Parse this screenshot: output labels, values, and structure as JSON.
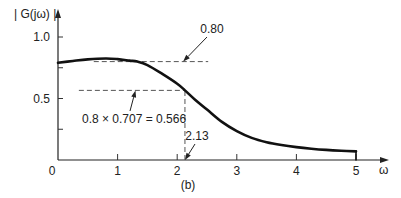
{
  "chart_data": {
    "type": "line",
    "title": "",
    "caption": "(b)",
    "xlabel": "ω",
    "ylabel": "| G(jω) |",
    "xlim": [
      0,
      5
    ],
    "ylim": [
      0,
      1.0
    ],
    "grid": false,
    "x_ticks": [
      0,
      1,
      2,
      3,
      4,
      5
    ],
    "x_tick_labels": [
      "0",
      "1",
      "2",
      "3",
      "4",
      "5"
    ],
    "y_ticks": [
      0.25,
      0.5,
      0.75,
      1.0
    ],
    "y_tick_labels": [
      "",
      "0.5",
      "",
      "1.0"
    ],
    "series": [
      {
        "name": "|G(jω)|",
        "x": [
          0,
          0.25,
          0.5,
          0.8,
          1.0,
          1.2,
          1.33,
          1.5,
          1.75,
          2.0,
          2.13,
          2.3,
          2.5,
          2.75,
          3.0,
          3.25,
          3.5,
          3.75,
          4.0,
          4.25,
          4.5,
          4.75,
          5.0
        ],
        "values": [
          0.79,
          0.805,
          0.818,
          0.825,
          0.82,
          0.808,
          0.8,
          0.772,
          0.7,
          0.62,
          0.566,
          0.49,
          0.41,
          0.31,
          0.235,
          0.18,
          0.145,
          0.122,
          0.105,
          0.092,
          0.082,
          0.075,
          0.07
        ]
      }
    ],
    "reference_lines": [
      {
        "kind": "horizontal",
        "y": 0.8,
        "x_from": 0.6,
        "x_to": 2.52
      },
      {
        "kind": "horizontal",
        "y": 0.566,
        "x_from": 0.35,
        "x_to": 2.13
      },
      {
        "kind": "vertical",
        "x": 2.13,
        "y_from": 0,
        "y_to": 0.566
      }
    ],
    "annotations": [
      {
        "text": "0.80",
        "points_to": [
          2.1,
          0.8
        ]
      },
      {
        "text": "0.8 × 0.707 = 0.566",
        "points_to": [
          1.3,
          0.566
        ]
      },
      {
        "text": "2.13",
        "points_to": [
          2.13,
          0
        ]
      }
    ]
  }
}
